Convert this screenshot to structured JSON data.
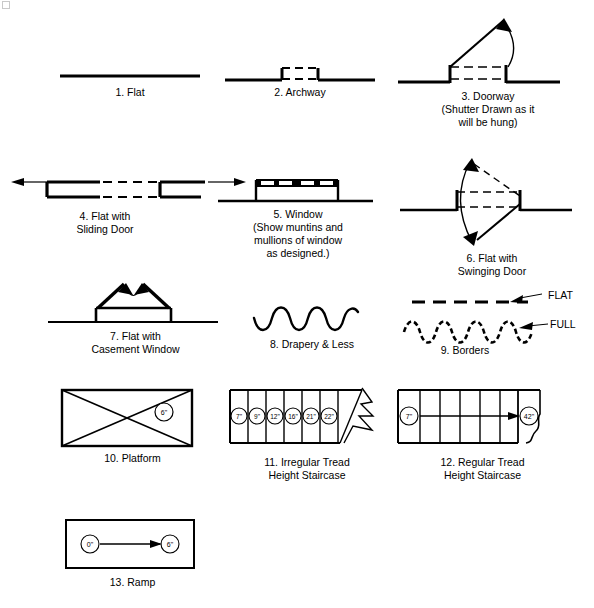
{
  "sheet": {
    "title": "Theatrical Floor Plan Symbol Legend",
    "stroke_color": "#000000",
    "background": "#ffffff"
  },
  "figures": [
    {
      "id": 1,
      "name": "flat",
      "number": "1.",
      "caption": "1.  Flat",
      "lines": [
        "1.  Flat"
      ]
    },
    {
      "id": 2,
      "name": "archway",
      "number": "2.",
      "caption": "2.  Archway",
      "lines": [
        "2.  Archway"
      ]
    },
    {
      "id": 3,
      "name": "doorway",
      "number": "3.",
      "caption": "3.  Doorway\n(Shutter Drawn as it\nwill be hung)",
      "lines": [
        "3.  Doorway",
        "(Shutter Drawn as it",
        "will be hung)"
      ]
    },
    {
      "id": 4,
      "name": "flat-with-sliding-door",
      "number": "4.",
      "caption": "4.  Flat with\nSliding Door",
      "lines": [
        "4.  Flat with",
        "Sliding Door"
      ]
    },
    {
      "id": 5,
      "name": "window",
      "number": "5.",
      "caption": "5.  Window\n(Show muntins and\nmullions of window\nas designed.)",
      "lines": [
        "5.  Window",
        "(Show muntins and",
        "mullions of window",
        "as designed.)"
      ]
    },
    {
      "id": 6,
      "name": "flat-with-swinging-door",
      "number": "6.",
      "caption": "6.  Flat with\nSwinging Door",
      "lines": [
        "6.  Flat with",
        "Swinging Door"
      ]
    },
    {
      "id": 7,
      "name": "flat-with-casement-window",
      "number": "7.",
      "caption": "7.  Flat with\nCasement Window",
      "lines": [
        "7.  Flat with",
        "Casement Window"
      ]
    },
    {
      "id": 8,
      "name": "drapery-and-less",
      "number": "8.",
      "caption": "8.  Drapery & Less",
      "lines": [
        "8.  Drapery & Less"
      ]
    },
    {
      "id": 9,
      "name": "borders",
      "number": "9.",
      "caption": "9.  Borders",
      "lines": [
        "9.  Borders"
      ],
      "annotations": [
        {
          "label": "FLAT",
          "target": "dashed-straight-line"
        },
        {
          "label": "FULL",
          "target": "dashed-wavy-line"
        }
      ]
    },
    {
      "id": 10,
      "name": "platform",
      "number": "10.",
      "caption": "10.  Platform",
      "lines": [
        "10.  Platform"
      ],
      "height_tags": [
        "6\""
      ]
    },
    {
      "id": 11,
      "name": "irregular-tread-height-staircase",
      "number": "11.",
      "caption": "11.  Irregular Tread\nHeight Staircase",
      "lines": [
        "11.  Irregular Tread",
        "Height Staircase"
      ],
      "tread_heights": [
        "7\"",
        "9\"",
        "12\"",
        "16\"",
        "21\"",
        "22\""
      ]
    },
    {
      "id": 12,
      "name": "regular-tread-height-staircase",
      "number": "12.",
      "caption": "12.  Regular Tread\nHeight Staircase",
      "lines": [
        "12.  Regular Tread",
        "Height Staircase"
      ],
      "start_height": "7\"",
      "end_height": "42\""
    },
    {
      "id": 13,
      "name": "ramp",
      "number": "13.",
      "caption": "13.  Ramp",
      "lines": [
        "13.  Ramp"
      ],
      "start_height": "0\"",
      "end_height": "6\""
    }
  ]
}
